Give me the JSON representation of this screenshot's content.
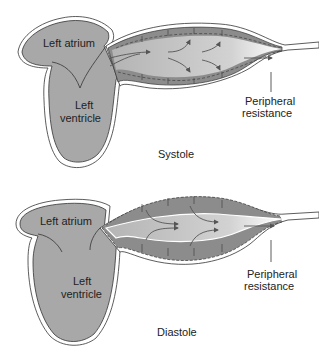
{
  "colors": {
    "heart_fill": "#a8a8a8",
    "wall_fill": "#8c8c8c",
    "lumen_fill": "#bdbdbd",
    "outline": "#333333",
    "arrow": "#555555",
    "background": "#ffffff"
  },
  "panels": [
    {
      "name": "systole",
      "caption": "Systole",
      "labels": {
        "atrium": "Left atrium",
        "ventricle_line1": "Left",
        "ventricle_line2": "ventricle",
        "resistance_line1": "Peripheral",
        "resistance_line2": "resistance"
      }
    },
    {
      "name": "diastole",
      "caption": "Diastole",
      "labels": {
        "atrium": "Left atrium",
        "ventricle_line1": "Left",
        "ventricle_line2": "ventricle",
        "resistance_line1": "Peripheral",
        "resistance_line2": "resistance"
      }
    }
  ]
}
